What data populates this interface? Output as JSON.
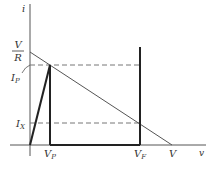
{
  "diagram": {
    "type": "i-v characteristic with load line",
    "axes": {
      "y_label": "i",
      "x_label": "v"
    },
    "y_ticks": {
      "v_over_r_num": "V",
      "v_over_r_den": "R",
      "ip_main": "I",
      "ip_sub": "P",
      "ix_main": "I",
      "ix_sub": "X"
    },
    "x_ticks": {
      "vp_main": "V",
      "vp_sub": "P",
      "vf_main": "V",
      "vf_sub": "F",
      "v": "V"
    },
    "colors": {
      "axis": "#555555",
      "curve": "#222222",
      "dashed": "#777777",
      "load_line": "#555555"
    }
  }
}
